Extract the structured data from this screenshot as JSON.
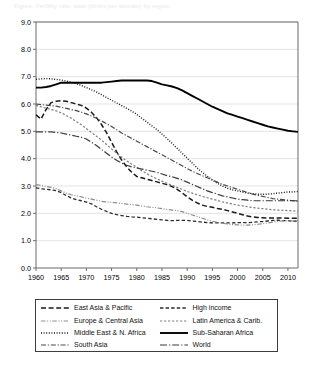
{
  "caption": {
    "text": "Figure: Fertility rate, total (births per woman) by region"
  },
  "legend": {
    "items": [
      {
        "label": "East Asia & Pacific",
        "key": "east_asia_pacific",
        "style": "dashed-long",
        "color": "#1a1a1a",
        "width": 1.5
      },
      {
        "label": "High income",
        "key": "high_income",
        "style": "dashed-med",
        "color": "#2b2b2b",
        "width": 1.3
      },
      {
        "label": "Europe & Central Asia",
        "key": "europe_central_asia",
        "style": "dash-dot-dot",
        "color": "#8d8d8d",
        "width": 1.2
      },
      {
        "label": "Latin America & Carib.",
        "key": "latin_america_carib",
        "style": "dashed-short",
        "color": "#7d7d7d",
        "width": 1.2
      },
      {
        "label": "Middle East & N. Africa",
        "key": "middle_east_n_africa",
        "style": "dotted",
        "color": "#1a1a1a",
        "width": 1.4
      },
      {
        "label": "Sub-Saharan Africa",
        "key": "sub_saharan_africa",
        "style": "solid",
        "color": "#000000",
        "width": 1.9
      },
      {
        "label": "South Asia",
        "key": "south_asia",
        "style": "dash-dot",
        "color": "#4a4a4a",
        "width": 1.2
      },
      {
        "label": "World",
        "key": "world",
        "style": "dash-dot-long",
        "color": "#3a3a3a",
        "width": 1.2
      }
    ]
  },
  "chart_data": {
    "type": "line",
    "title": "",
    "xlabel": "",
    "ylabel": "",
    "xlim": [
      1960,
      2012
    ],
    "ylim": [
      0.0,
      9.0
    ],
    "grid": "horizontal",
    "legend_position": "bottom",
    "ytick_labels": [
      "0.0",
      "1.0",
      "2.0",
      "3.0",
      "4.0",
      "5.0",
      "6.0",
      "7.0",
      "8.0",
      "9.0"
    ],
    "ytick_values": [
      0.0,
      1.0,
      2.0,
      3.0,
      4.0,
      5.0,
      6.0,
      7.0,
      8.0,
      9.0
    ],
    "xtick_labels": [
      "1960",
      "1965",
      "1970",
      "1975",
      "1980",
      "1985",
      "1990",
      "1995",
      "2000",
      "2005",
      "2010"
    ],
    "xtick_values": [
      1960,
      1965,
      1970,
      1975,
      1980,
      1985,
      1990,
      1995,
      2000,
      2005,
      2010
    ],
    "x": [
      1960,
      1961,
      1962,
      1963,
      1964,
      1965,
      1966,
      1967,
      1968,
      1969,
      1970,
      1971,
      1972,
      1973,
      1974,
      1975,
      1976,
      1977,
      1978,
      1979,
      1980,
      1981,
      1982,
      1983,
      1984,
      1985,
      1986,
      1987,
      1988,
      1989,
      1990,
      1991,
      1992,
      1993,
      1994,
      1995,
      1996,
      1997,
      1998,
      1999,
      2000,
      2001,
      2002,
      2003,
      2004,
      2005,
      2006,
      2007,
      2008,
      2009,
      2010,
      2011,
      2012
    ],
    "series": [
      {
        "name": "East Asia & Pacific",
        "key": "east_asia_pacific",
        "style": "dashed-long",
        "color": "#1a1a1a",
        "width": 1.5,
        "values": [
          5.6,
          5.45,
          5.8,
          6.05,
          6.1,
          6.12,
          6.1,
          6.05,
          6.0,
          5.95,
          5.85,
          5.7,
          5.5,
          5.25,
          4.95,
          4.6,
          4.25,
          3.95,
          3.7,
          3.5,
          3.35,
          3.3,
          3.25,
          3.2,
          3.15,
          3.1,
          3.05,
          2.98,
          2.88,
          2.75,
          2.6,
          2.48,
          2.38,
          2.3,
          2.25,
          2.22,
          2.18,
          2.15,
          2.1,
          2.05,
          2.0,
          1.95,
          1.9,
          1.87,
          1.85,
          1.84,
          1.83,
          1.83,
          1.83,
          1.83,
          1.82,
          1.82,
          1.82
        ]
      },
      {
        "name": "High income",
        "key": "high_income",
        "style": "dashed-med",
        "color": "#2b2b2b",
        "width": 1.3,
        "values": [
          2.93,
          2.9,
          2.88,
          2.86,
          2.83,
          2.76,
          2.65,
          2.56,
          2.5,
          2.46,
          2.41,
          2.35,
          2.24,
          2.15,
          2.07,
          2.0,
          1.95,
          1.92,
          1.89,
          1.87,
          1.86,
          1.84,
          1.82,
          1.8,
          1.78,
          1.76,
          1.74,
          1.73,
          1.74,
          1.74,
          1.74,
          1.72,
          1.7,
          1.68,
          1.66,
          1.65,
          1.65,
          1.65,
          1.65,
          1.65,
          1.66,
          1.66,
          1.66,
          1.67,
          1.69,
          1.7,
          1.72,
          1.74,
          1.75,
          1.73,
          1.73,
          1.71,
          1.72
        ]
      },
      {
        "name": "Europe & Central Asia",
        "key": "europe_central_asia",
        "style": "dash-dot-dot",
        "color": "#8d8d8d",
        "width": 1.2,
        "values": [
          3.05,
          3.02,
          2.98,
          2.95,
          2.9,
          2.82,
          2.74,
          2.68,
          2.64,
          2.6,
          2.56,
          2.52,
          2.48,
          2.44,
          2.42,
          2.4,
          2.38,
          2.36,
          2.34,
          2.32,
          2.3,
          2.27,
          2.24,
          2.22,
          2.2,
          2.17,
          2.14,
          2.12,
          2.1,
          2.06,
          2.0,
          1.94,
          1.88,
          1.82,
          1.76,
          1.71,
          1.67,
          1.64,
          1.61,
          1.59,
          1.58,
          1.57,
          1.57,
          1.58,
          1.6,
          1.62,
          1.65,
          1.68,
          1.71,
          1.72,
          1.73,
          1.72,
          1.74
        ]
      },
      {
        "name": "Latin America & Carib.",
        "key": "latin_america_carib",
        "style": "dashed-short",
        "color": "#7d7d7d",
        "width": 1.2,
        "values": [
          5.95,
          5.9,
          5.85,
          5.8,
          5.75,
          5.68,
          5.58,
          5.48,
          5.36,
          5.24,
          5.1,
          4.96,
          4.82,
          4.68,
          4.52,
          4.36,
          4.2,
          4.05,
          3.92,
          3.8,
          3.68,
          3.56,
          3.45,
          3.35,
          3.26,
          3.18,
          3.1,
          3.02,
          2.95,
          2.88,
          2.8,
          2.74,
          2.68,
          2.62,
          2.57,
          2.52,
          2.47,
          2.42,
          2.38,
          2.34,
          2.3,
          2.27,
          2.24,
          2.21,
          2.19,
          2.17,
          2.15,
          2.13,
          2.12,
          2.11,
          2.1,
          2.09,
          2.08
        ]
      },
      {
        "name": "Middle East & N. Africa",
        "key": "middle_east_n_africa",
        "style": "dotted",
        "color": "#1a1a1a",
        "width": 1.4,
        "values": [
          6.9,
          6.92,
          6.93,
          6.92,
          6.9,
          6.88,
          6.84,
          6.8,
          6.74,
          6.68,
          6.6,
          6.52,
          6.44,
          6.34,
          6.24,
          6.14,
          6.04,
          5.94,
          5.84,
          5.74,
          5.62,
          5.48,
          5.34,
          5.2,
          5.06,
          4.9,
          4.74,
          4.56,
          4.38,
          4.2,
          4.02,
          3.84,
          3.66,
          3.5,
          3.36,
          3.22,
          3.1,
          3.0,
          2.92,
          2.86,
          2.82,
          2.78,
          2.74,
          2.72,
          2.7,
          2.7,
          2.7,
          2.72,
          2.74,
          2.76,
          2.78,
          2.78,
          2.8
        ]
      },
      {
        "name": "Sub-Saharan Africa",
        "key": "sub_saharan_africa",
        "style": "solid",
        "color": "#000000",
        "width": 1.9,
        "values": [
          6.6,
          6.6,
          6.62,
          6.66,
          6.72,
          6.78,
          6.78,
          6.78,
          6.78,
          6.78,
          6.78,
          6.78,
          6.78,
          6.78,
          6.8,
          6.82,
          6.84,
          6.86,
          6.86,
          6.86,
          6.86,
          6.86,
          6.86,
          6.84,
          6.78,
          6.72,
          6.68,
          6.64,
          6.58,
          6.5,
          6.4,
          6.3,
          6.2,
          6.1,
          6.0,
          5.9,
          5.82,
          5.74,
          5.66,
          5.6,
          5.54,
          5.48,
          5.42,
          5.36,
          5.3,
          5.24,
          5.18,
          5.14,
          5.1,
          5.06,
          5.02,
          5.0,
          4.98
        ]
      },
      {
        "name": "South Asia",
        "key": "south_asia",
        "style": "dash-dot",
        "color": "#4a4a4a",
        "width": 1.2,
        "values": [
          6.0,
          5.98,
          5.96,
          5.94,
          5.92,
          5.88,
          5.84,
          5.8,
          5.76,
          5.7,
          5.64,
          5.56,
          5.48,
          5.38,
          5.28,
          5.18,
          5.06,
          4.94,
          4.84,
          4.74,
          4.64,
          4.54,
          4.44,
          4.34,
          4.24,
          4.14,
          4.04,
          3.94,
          3.84,
          3.74,
          3.64,
          3.54,
          3.46,
          3.38,
          3.3,
          3.22,
          3.14,
          3.06,
          3.0,
          2.94,
          2.88,
          2.82,
          2.76,
          2.7,
          2.66,
          2.62,
          2.58,
          2.54,
          2.52,
          2.5,
          2.48,
          2.46,
          2.44
        ]
      },
      {
        "name": "World",
        "key": "world",
        "style": "dash-dot-long",
        "color": "#3a3a3a",
        "width": 1.2,
        "values": [
          4.98,
          4.98,
          4.98,
          4.98,
          4.96,
          4.94,
          4.9,
          4.86,
          4.82,
          4.78,
          4.72,
          4.6,
          4.48,
          4.34,
          4.2,
          4.06,
          3.94,
          3.84,
          3.76,
          3.7,
          3.66,
          3.62,
          3.58,
          3.54,
          3.5,
          3.44,
          3.38,
          3.34,
          3.28,
          3.22,
          3.14,
          3.06,
          2.98,
          2.9,
          2.82,
          2.76,
          2.7,
          2.64,
          2.6,
          2.56,
          2.52,
          2.5,
          2.48,
          2.46,
          2.46,
          2.46,
          2.46,
          2.46,
          2.46,
          2.46,
          2.46,
          2.46,
          2.46
        ]
      }
    ]
  }
}
